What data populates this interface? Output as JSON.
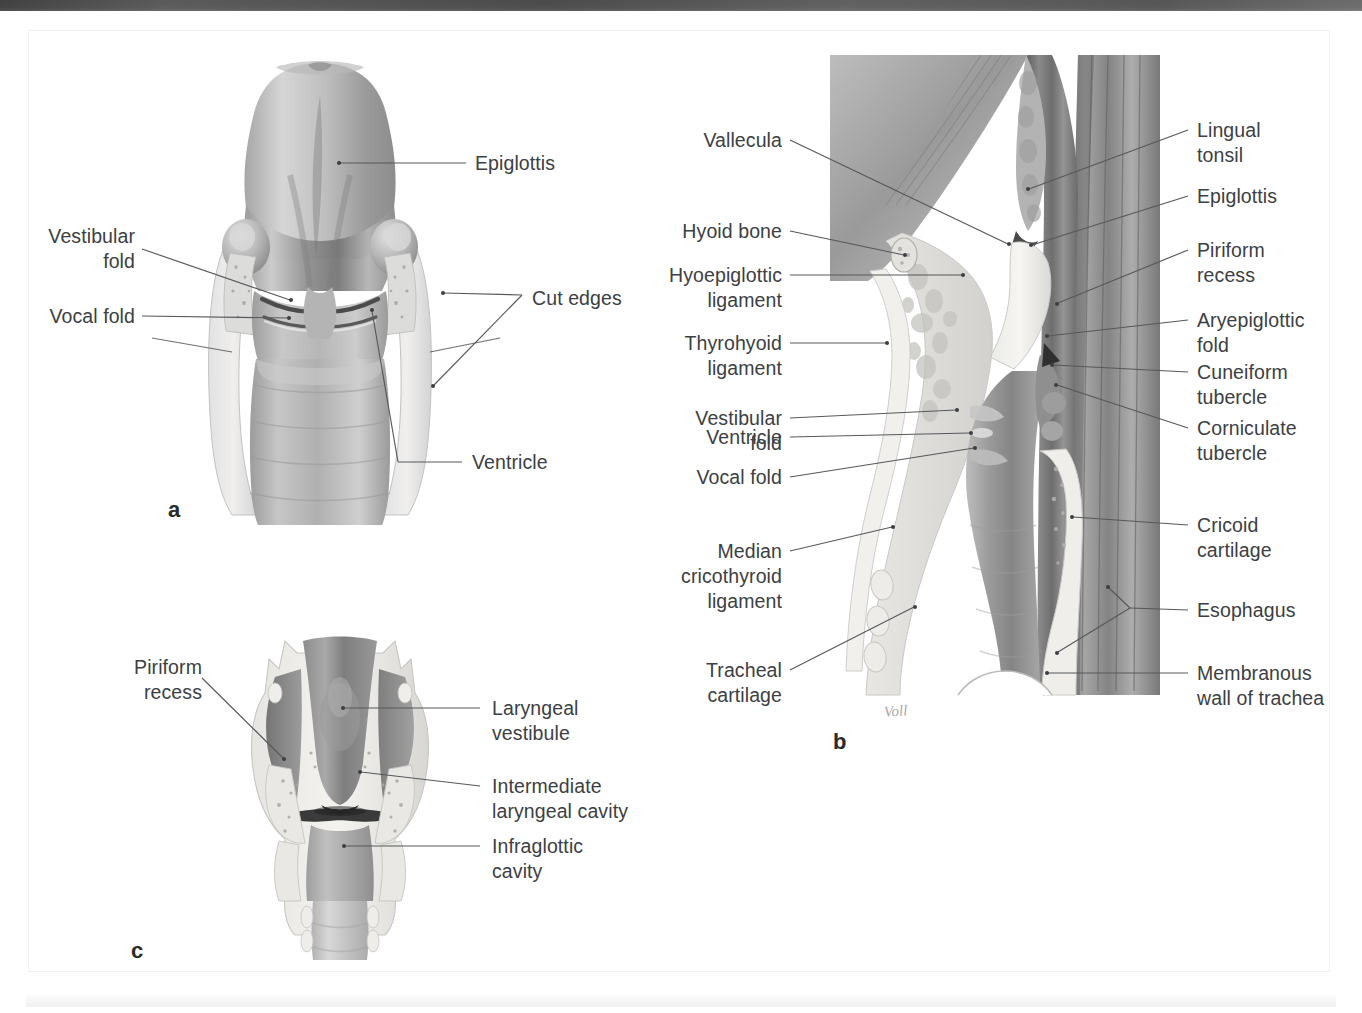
{
  "figure": {
    "domain": "anatomical-illustration",
    "artist_signature": "Voll",
    "ink_color": "#3c4043",
    "leader_color": "#55585c"
  },
  "panels": [
    {
      "id": "a",
      "letter": "a",
      "view": "posterior view of opened larynx",
      "labels": [
        {
          "id": "a-epiglottis",
          "text": "Epiglottis",
          "side": "right"
        },
        {
          "id": "a-vestibular-fold",
          "text": "Vestibular\nfold",
          "side": "left"
        },
        {
          "id": "a-vocal-fold",
          "text": "Vocal fold",
          "side": "left"
        },
        {
          "id": "a-cut-edges",
          "text": "Cut edges",
          "side": "right"
        },
        {
          "id": "a-ventricle",
          "text": "Ventricle",
          "side": "right"
        }
      ]
    },
    {
      "id": "b",
      "letter": "b",
      "view": "midsagittal section of larynx and pharynx",
      "labels": [
        {
          "id": "b-vallecula",
          "text": "Vallecula",
          "side": "left"
        },
        {
          "id": "b-hyoid-bone",
          "text": "Hyoid bone",
          "side": "left"
        },
        {
          "id": "b-hyoepiglottic",
          "text": "Hyoepiglottic\nligament",
          "side": "left"
        },
        {
          "id": "b-thyrohyoid",
          "text": "Thyrohyoid\nligament",
          "side": "left"
        },
        {
          "id": "b-vestibular-fold",
          "text": "Vestibular\nfold",
          "side": "left"
        },
        {
          "id": "b-ventricle",
          "text": "Ventricle",
          "side": "left"
        },
        {
          "id": "b-vocal-fold",
          "text": "Vocal fold",
          "side": "left"
        },
        {
          "id": "b-median-cricothyroid",
          "text": "Median\ncricothyroid\nligament",
          "side": "left"
        },
        {
          "id": "b-tracheal-cartilage",
          "text": "Tracheal\ncartilage",
          "side": "left"
        },
        {
          "id": "b-lingual-tonsil",
          "text": "Lingual\ntonsil",
          "side": "right"
        },
        {
          "id": "b-epiglottis",
          "text": "Epiglottis",
          "side": "right"
        },
        {
          "id": "b-piriform-recess",
          "text": "Piriform\nrecess",
          "side": "right"
        },
        {
          "id": "b-aryepiglottic-fold",
          "text": "Aryepiglottic\nfold",
          "side": "right"
        },
        {
          "id": "b-cuneiform-tubercle",
          "text": "Cuneiform\ntubercle",
          "side": "right"
        },
        {
          "id": "b-corniculate-tubercle",
          "text": "Corniculate\ntubercle",
          "side": "right"
        },
        {
          "id": "b-cricoid-cartilage",
          "text": "Cricoid\ncartilage",
          "side": "right"
        },
        {
          "id": "b-esophagus",
          "text": "Esophagus",
          "side": "right"
        },
        {
          "id": "b-membranous-wall",
          "text": "Membranous\nwall of trachea",
          "side": "right"
        }
      ]
    },
    {
      "id": "c",
      "letter": "c",
      "view": "coronal section of larynx",
      "labels": [
        {
          "id": "c-piriform-recess",
          "text": "Piriform\nrecess",
          "side": "left"
        },
        {
          "id": "c-laryngeal-vest",
          "text": "Laryngeal\nvestibule",
          "side": "right"
        },
        {
          "id": "c-intermediate",
          "text": "Intermediate\nlaryngeal cavity",
          "side": "right"
        },
        {
          "id": "c-infraglottic",
          "text": "Infraglottic\ncavity",
          "side": "right"
        }
      ]
    }
  ]
}
